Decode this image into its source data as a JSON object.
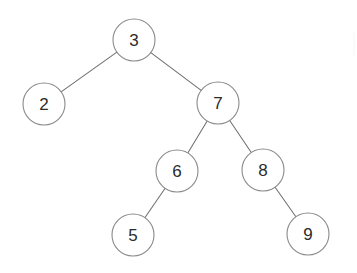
{
  "figure": {
    "kind": "binary-search-tree-diagram",
    "width": 357,
    "height": 273,
    "background_color": "#ffffff",
    "node_fill_color": "#ffffff",
    "node_stroke_color": "#8a8a8a",
    "edge_color": "#6f6f6f",
    "label_color": "#2b2b2b",
    "node_radius": 21
  },
  "chart_data": {
    "type": "diagram",
    "diagram_type": "binary-search-tree",
    "title": "",
    "root": "3",
    "node_count": 7,
    "depth": 4,
    "traversal_inorder": [
      "2",
      "3",
      "5",
      "6",
      "7",
      "8",
      "9"
    ],
    "nodes": [
      {
        "id": "n3",
        "label": "3",
        "cx": 134,
        "cy": 40,
        "r": 21,
        "depth": 0
      },
      {
        "id": "n2",
        "label": "2",
        "cx": 44,
        "cy": 104,
        "r": 21,
        "depth": 1
      },
      {
        "id": "n7",
        "label": "7",
        "cx": 218,
        "cy": 103,
        "r": 21,
        "depth": 1
      },
      {
        "id": "n6",
        "label": "6",
        "cx": 177,
        "cy": 171,
        "r": 21,
        "depth": 2
      },
      {
        "id": "n8",
        "label": "8",
        "cx": 263,
        "cy": 170,
        "r": 21,
        "depth": 2
      },
      {
        "id": "n5",
        "label": "5",
        "cx": 133,
        "cy": 235,
        "r": 21,
        "depth": 3
      },
      {
        "id": "n9",
        "label": "9",
        "cx": 308,
        "cy": 234,
        "r": 21,
        "depth": 3
      }
    ],
    "edges": [
      {
        "from": "3",
        "to": "2",
        "side": "left"
      },
      {
        "from": "3",
        "to": "7",
        "side": "right"
      },
      {
        "from": "7",
        "to": "6",
        "side": "left"
      },
      {
        "from": "7",
        "to": "8",
        "side": "right"
      },
      {
        "from": "6",
        "to": "5",
        "side": "left"
      },
      {
        "from": "8",
        "to": "9",
        "side": "right"
      }
    ]
  }
}
